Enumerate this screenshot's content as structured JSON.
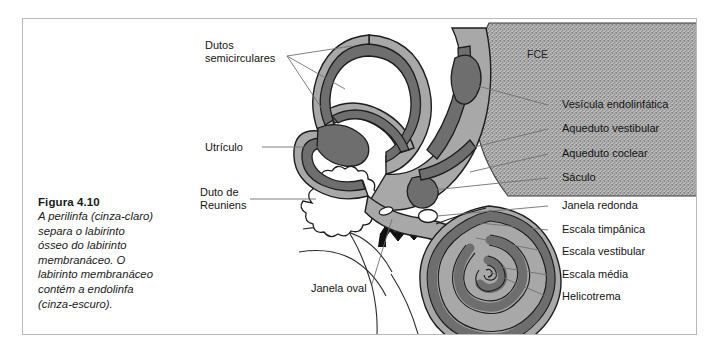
{
  "figure": {
    "number_label": "Figura 4.10",
    "caption_lines": [
      "A perilinfa (cinza-claro)",
      "separa o labirinto",
      "ósseo do labirinto",
      "membranáceo. O",
      "labirinto membranáceo",
      "contém a endolinfa",
      "(cinza-escuro)."
    ]
  },
  "labels": {
    "left": [
      {
        "id": "dutos",
        "lines": [
          "Dutos",
          "semicirculares"
        ]
      },
      {
        "id": "utriculo",
        "lines": [
          "Utrículo"
        ]
      },
      {
        "id": "duto_reuniens",
        "lines": [
          "Duto de",
          "Reuniens"
        ]
      },
      {
        "id": "janela_oval",
        "lines": [
          "Janela oval"
        ]
      }
    ],
    "right": [
      {
        "id": "vesicula",
        "text": "Vesícula endolinfática"
      },
      {
        "id": "aq_vest",
        "text": "Aqueduto vestibular"
      },
      {
        "id": "aq_coclear",
        "text": "Aqueduto coclear"
      },
      {
        "id": "saculo",
        "text": "Sáculo"
      },
      {
        "id": "janela_red",
        "text": "Janela redonda"
      },
      {
        "id": "esc_timp",
        "text": "Escala timpânica"
      },
      {
        "id": "esc_vest",
        "text": "Escala vestibular"
      },
      {
        "id": "esc_media",
        "text": "Escala média"
      },
      {
        "id": "helicotrema",
        "text": "Helicotrema"
      }
    ],
    "region": {
      "fce": "FCE"
    }
  },
  "colors": {
    "frame_border": "#b9b9b9",
    "background": "#ffffff",
    "perilymph_light_gray": "#a8a8a8",
    "membranous_dark_gray": "#6e6e6e",
    "outline_black": "#1a1a1a",
    "stipple_gray": "#9b9b9b",
    "leader_line": "#707070",
    "text": "#141414"
  }
}
